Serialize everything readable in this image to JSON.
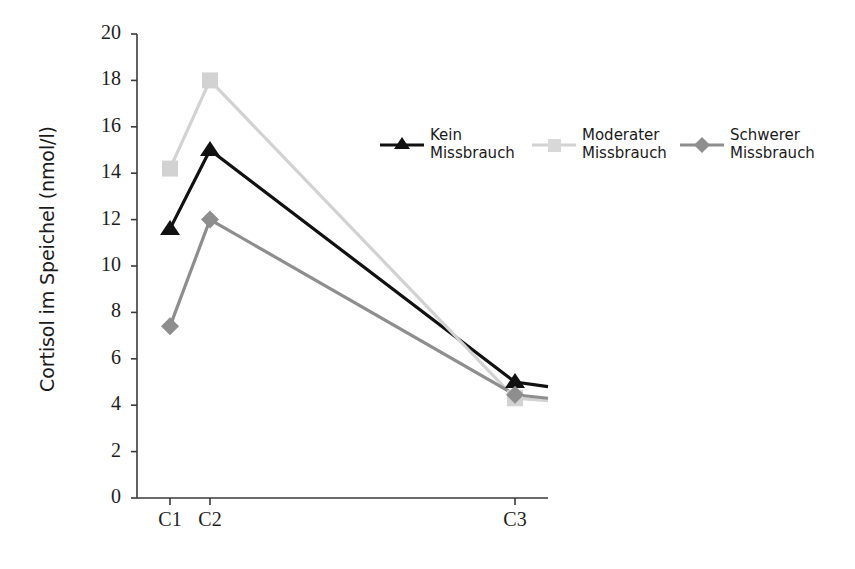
{
  "chart_data": {
    "type": "line",
    "title": "",
    "xlabel": "",
    "ylabel": "Cortisol im Speichel (nmol/l)",
    "categories": [
      "C1",
      "C2",
      "C3"
    ],
    "x_positions": [
      170,
      210,
      515
    ],
    "ylim": [
      0,
      20
    ],
    "yticks": [
      0,
      2,
      4,
      6,
      8,
      10,
      12,
      14,
      16,
      18,
      20
    ],
    "ytick_labels": [
      "0",
      "2",
      "4",
      "6",
      "8",
      "10",
      "12",
      "14",
      "16",
      "18",
      "20"
    ],
    "grid": false,
    "legend_position": "upper-center-right",
    "series": [
      {
        "name": "Kein\nMissbrauch",
        "label_line1": "Kein",
        "label_line2": "Missbrauch",
        "marker": "triangle",
        "color": "#111111",
        "values": [
          11.6,
          15.0,
          5.0
        ],
        "tail_value": 4.8
      },
      {
        "name": "Moderater\nMissbrauch",
        "label_line1": "Moderater",
        "label_line2": "Missbrauch",
        "marker": "square",
        "color": "#d2d2d2",
        "values": [
          14.2,
          18.0,
          4.3
        ],
        "tail_value": 4.2
      },
      {
        "name": "Schwerer\nMissbrauch",
        "label_line1": "Schwerer",
        "label_line2": "Missbrauch",
        "marker": "diamond",
        "color": "#8e8e8e",
        "values": [
          7.4,
          12.0,
          4.45
        ],
        "tail_value": 4.3
      }
    ]
  },
  "axis": {
    "y_label": "Cortisol im Speichel (nmol/l)",
    "y_ticks": [
      "20",
      "18",
      "16",
      "14",
      "12",
      "10",
      "8",
      "6",
      "4",
      "2",
      "0"
    ],
    "x_ticks": [
      "C1",
      "C2",
      "C3"
    ],
    "axis_color": "#3a3a3a"
  },
  "legend": {
    "entries": [
      {
        "line1": "Kein",
        "line2": "Missbrauch",
        "marker": "triangle",
        "color": "#111111"
      },
      {
        "line1": "Moderater",
        "line2": "Missbrauch",
        "marker": "square",
        "color": "#d2d2d2"
      },
      {
        "line1": "Schwerer",
        "line2": "Missbrauch",
        "marker": "diamond",
        "color": "#8e8e8e"
      }
    ]
  }
}
